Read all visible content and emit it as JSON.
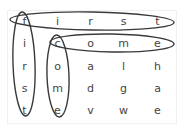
{
  "puzzle": {
    "grid": [
      [
        "f",
        "i",
        "r",
        "s",
        "t"
      ],
      [
        "i",
        "c",
        "o",
        "m",
        "e"
      ],
      [
        "r",
        "o",
        "a",
        "l",
        "h"
      ],
      [
        "s",
        "m",
        "d",
        "g",
        "a"
      ],
      [
        "t",
        "e",
        "v",
        "w",
        "e"
      ]
    ],
    "found_words": [
      {
        "word": "first",
        "direction": "horizontal",
        "row": 0,
        "start_col": 0
      },
      {
        "word": "come",
        "direction": "horizontal",
        "row": 1,
        "start_col": 1
      },
      {
        "word": "first",
        "direction": "vertical",
        "col": 0,
        "start_row": 0
      },
      {
        "word": "come",
        "direction": "vertical",
        "col": 1,
        "start_row": 1
      }
    ],
    "colors": {
      "text": "#444444",
      "loop": "#3a3a3a",
      "grid_line": "#f0f0f0"
    }
  }
}
